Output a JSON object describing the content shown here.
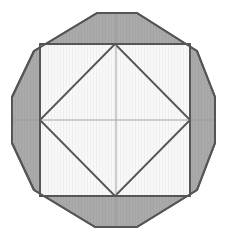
{
  "figure": {
    "type": "geometric-line-drawing",
    "canvas": {
      "width": 228,
      "height": 242,
      "background": "#ffffff"
    },
    "colors": {
      "outer_fill": "#a9a9a9",
      "inner_fill": "#f7f7f7",
      "stroke": "#555555",
      "faint_stroke": "#9a9a9a",
      "background": "#ffffff"
    },
    "stroke_widths": {
      "outline": 2.0,
      "inner": 1.6,
      "faint": 1.0
    },
    "shapes": [
      {
        "name": "outer-decagon",
        "sides": 10,
        "fill": "#a9a9a9",
        "points": [
          [
            97,
            13
          ],
          [
            137,
            13
          ],
          [
            197,
            51
          ],
          [
            215,
            97
          ],
          [
            215,
            143
          ],
          [
            197,
            190
          ],
          [
            137,
            227
          ],
          [
            95,
            227
          ],
          [
            34,
            190
          ],
          [
            12,
            143
          ],
          [
            12,
            97
          ],
          [
            34,
            51
          ]
        ],
        "points_note": "regular 12-gon approximation of the outer boundary with flat top and bottom and vertical left and right edges"
      },
      {
        "name": "inner-square",
        "sides": 4,
        "fill": "#f7f7f7",
        "points": [
          [
            40,
            44
          ],
          [
            190,
            44
          ],
          [
            190,
            196
          ],
          [
            40,
            196
          ]
        ]
      },
      {
        "name": "inner-diamond",
        "sides": 4,
        "fill": "#f7f7f7",
        "points": [
          [
            115,
            44
          ],
          [
            190,
            120
          ],
          [
            115,
            196
          ],
          [
            40,
            120
          ]
        ]
      }
    ],
    "lines": [
      {
        "name": "center-horizontal",
        "from": [
          12,
          120
        ],
        "to": [
          215,
          120
        ],
        "style": "faint"
      },
      {
        "name": "center-vertical",
        "from": [
          116,
          13
        ],
        "to": [
          116,
          227
        ],
        "style": "faint"
      },
      {
        "name": "diagonal-top-left",
        "from": [
          40,
          44
        ],
        "to": [
          115,
          120
        ],
        "style": "inner"
      },
      {
        "name": "diagonal-top-right",
        "from": [
          190,
          44
        ],
        "to": [
          115,
          120
        ],
        "style": "inner"
      },
      {
        "name": "diagonal-bottom-left",
        "from": [
          40,
          196
        ],
        "to": [
          115,
          120
        ],
        "style": "inner"
      },
      {
        "name": "diagonal-bottom-right",
        "from": [
          190,
          196
        ],
        "to": [
          115,
          120
        ],
        "style": "inner"
      }
    ],
    "vertices": [
      {
        "name": "vertex-top",
        "at": [
          115,
          44
        ]
      },
      {
        "name": "vertex-right",
        "at": [
          190,
          120
        ]
      },
      {
        "name": "vertex-bottom",
        "at": [
          115,
          196
        ]
      },
      {
        "name": "vertex-left",
        "at": [
          40,
          120
        ]
      }
    ]
  }
}
